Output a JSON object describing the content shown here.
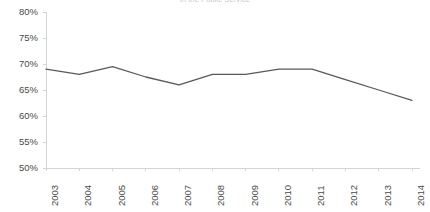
{
  "chart_data": {
    "type": "line",
    "title": "in the Public Service",
    "xlabel": "",
    "ylabel": "",
    "categories": [
      "2003",
      "2004",
      "2005",
      "2006",
      "2007",
      "2008",
      "2009",
      "2010",
      "2011",
      "2012",
      "2013",
      "2014"
    ],
    "values": [
      69,
      68,
      69.5,
      67.5,
      66,
      68,
      68,
      69,
      69,
      67,
      65,
      63
    ],
    "series": [
      {
        "name": "",
        "values": [
          69,
          68,
          69.5,
          67.5,
          66,
          68,
          68,
          69,
          69,
          67,
          65,
          63
        ]
      }
    ],
    "ylim": [
      50,
      80
    ],
    "ytick_values": [
      80,
      75,
      70,
      65,
      60,
      55,
      50
    ],
    "ytick_labels": [
      "80%",
      "75%",
      "70%",
      "65%",
      "60%",
      "55%",
      "50%"
    ],
    "xtick_labels": [
      "2003",
      "2004",
      "2005",
      "2006",
      "2007",
      "2008",
      "2009",
      "2010",
      "2011",
      "2012",
      "2013",
      "2014"
    ],
    "grid": false,
    "legend": false,
    "legend_position": "none",
    "line_color": "#595959",
    "axis_color": "#d4d4d4",
    "tick_label_color": "#4a4a4a",
    "background_color": "#ffffff"
  },
  "axes": {
    "y_axis_name": "percent-axis",
    "x_axis_name": "year-axis"
  }
}
